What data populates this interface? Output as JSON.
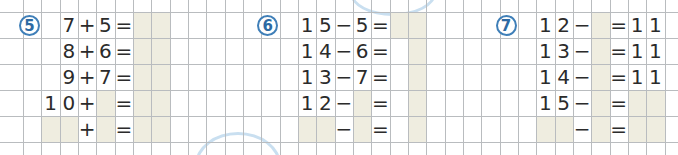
{
  "grid": {
    "col_width": 18.33,
    "row_height": 26,
    "x0": 23,
    "y0": 12,
    "cols": 36,
    "rows": 6,
    "line_color": "#b9bcbf",
    "shade_color": "#efede0",
    "accent": "#3f7fb8"
  },
  "exercises": [
    {
      "number": "5",
      "badge_col": 0,
      "rows": [
        {
          "cells": [
            {
              "col": 2,
              "text": "7"
            },
            {
              "col": 3,
              "text": "+"
            },
            {
              "col": 4,
              "text": "5"
            },
            {
              "col": 5,
              "text": "="
            }
          ],
          "shaded": [
            6,
            7
          ]
        },
        {
          "cells": [
            {
              "col": 2,
              "text": "8"
            },
            {
              "col": 3,
              "text": "+"
            },
            {
              "col": 4,
              "text": "6"
            },
            {
              "col": 5,
              "text": "="
            }
          ],
          "shaded": [
            6,
            7
          ]
        },
        {
          "cells": [
            {
              "col": 2,
              "text": "9"
            },
            {
              "col": 3,
              "text": "+"
            },
            {
              "col": 4,
              "text": "7"
            },
            {
              "col": 5,
              "text": "="
            }
          ],
          "shaded": [
            6,
            7
          ]
        },
        {
          "cells": [
            {
              "col": 1,
              "text": "1"
            },
            {
              "col": 2,
              "text": "0"
            },
            {
              "col": 3,
              "text": "+"
            },
            {
              "col": 5,
              "text": "="
            }
          ],
          "shaded": [
            4,
            6,
            7
          ]
        },
        {
          "cells": [
            {
              "col": 3,
              "text": "+"
            },
            {
              "col": 5,
              "text": "="
            }
          ],
          "shaded": [
            1,
            2,
            4,
            6,
            7
          ]
        }
      ]
    },
    {
      "number": "6",
      "badge_col": 13,
      "rows": [
        {
          "cells": [
            {
              "col": 15,
              "text": "1"
            },
            {
              "col": 16,
              "text": "5"
            },
            {
              "col": 17,
              "text": "−"
            },
            {
              "col": 18,
              "text": "5"
            },
            {
              "col": 19,
              "text": "="
            }
          ],
          "shaded": [
            20,
            21
          ]
        },
        {
          "cells": [
            {
              "col": 15,
              "text": "1"
            },
            {
              "col": 16,
              "text": "4"
            },
            {
              "col": 17,
              "text": "−"
            },
            {
              "col": 18,
              "text": "6"
            },
            {
              "col": 19,
              "text": "="
            }
          ],
          "shaded": [
            21
          ]
        },
        {
          "cells": [
            {
              "col": 15,
              "text": "1"
            },
            {
              "col": 16,
              "text": "3"
            },
            {
              "col": 17,
              "text": "−"
            },
            {
              "col": 18,
              "text": "7"
            },
            {
              "col": 19,
              "text": "="
            }
          ],
          "shaded": [
            21
          ]
        },
        {
          "cells": [
            {
              "col": 15,
              "text": "1"
            },
            {
              "col": 16,
              "text": "2"
            },
            {
              "col": 17,
              "text": "−"
            },
            {
              "col": 19,
              "text": "="
            }
          ],
          "shaded": [
            18,
            21
          ]
        },
        {
          "cells": [
            {
              "col": 17,
              "text": "−"
            },
            {
              "col": 19,
              "text": "="
            }
          ],
          "shaded": [
            15,
            16,
            18,
            21
          ]
        }
      ]
    },
    {
      "number": "7",
      "badge_col": 26,
      "rows": [
        {
          "cells": [
            {
              "col": 28,
              "text": "1"
            },
            {
              "col": 29,
              "text": "2"
            },
            {
              "col": 30,
              "text": "−"
            },
            {
              "col": 32,
              "text": "="
            },
            {
              "col": 33,
              "text": "1"
            },
            {
              "col": 34,
              "text": "1"
            }
          ],
          "shaded": [
            31
          ]
        },
        {
          "cells": [
            {
              "col": 28,
              "text": "1"
            },
            {
              "col": 29,
              "text": "3"
            },
            {
              "col": 30,
              "text": "−"
            },
            {
              "col": 32,
              "text": "="
            },
            {
              "col": 33,
              "text": "1"
            },
            {
              "col": 34,
              "text": "1"
            }
          ],
          "shaded": [
            31
          ]
        },
        {
          "cells": [
            {
              "col": 28,
              "text": "1"
            },
            {
              "col": 29,
              "text": "4"
            },
            {
              "col": 30,
              "text": "−"
            },
            {
              "col": 32,
              "text": "="
            },
            {
              "col": 33,
              "text": "1"
            },
            {
              "col": 34,
              "text": "1"
            }
          ],
          "shaded": [
            31
          ]
        },
        {
          "cells": [
            {
              "col": 28,
              "text": "1"
            },
            {
              "col": 29,
              "text": "5"
            },
            {
              "col": 30,
              "text": "−"
            },
            {
              "col": 32,
              "text": "="
            }
          ],
          "shaded": [
            31,
            33,
            34
          ]
        },
        {
          "cells": [
            {
              "col": 30,
              "text": "−"
            },
            {
              "col": 32,
              "text": "="
            }
          ],
          "shaded": [
            28,
            29,
            31,
            33,
            34
          ]
        }
      ]
    }
  ]
}
